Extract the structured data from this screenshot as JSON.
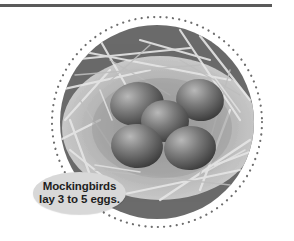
{
  "figure": {
    "egg_count": 5,
    "colors": {
      "rule": "#5a5a5a",
      "disc": "#6b6b6b",
      "dots": "#6e6e6e",
      "straw": "#d4d4d4",
      "egg": "#7a7a7a",
      "callout_bg": "#d8d8d8",
      "callout_text": "#1e1e1e"
    }
  },
  "callout": {
    "line1": "Mockingbirds",
    "line2": "lay 3 to 5 eggs."
  }
}
